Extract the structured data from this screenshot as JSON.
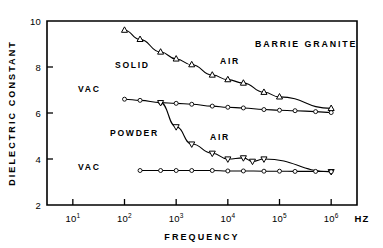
{
  "figure": {
    "annotation_title": "BARRIE GRANITE",
    "x_axis_title": "FREQUENCY",
    "x_axis_unit": "HZ",
    "y_axis_title": "DIELECTRIC CONSTANT",
    "labels": {
      "solid": "SOLID",
      "powder": "POWDER",
      "air_upper": "AIR",
      "air_lower": "AIR",
      "vac_upper": "VAC",
      "vac_lower": "VAC"
    }
  },
  "chart_data": {
    "type": "line",
    "title": "BARRIE GRANITE",
    "xlabel": "FREQUENCY",
    "xunit": "HZ",
    "ylabel": "DIELECTRIC CONSTANT",
    "xscale": "log",
    "yscale": "linear",
    "xlim": [
      3.1622776601683795,
      3162277.6601683795
    ],
    "ylim": [
      2,
      10
    ],
    "x_tick_labels": [
      "10¹",
      "10²",
      "10³",
      "10⁴",
      "10⁵",
      "10⁶"
    ],
    "x_tick_bases": [
      "10",
      "10",
      "10",
      "10",
      "10",
      "10"
    ],
    "x_tick_exponents": [
      "1",
      "2",
      "3",
      "4",
      "5",
      "6"
    ],
    "x_tick_values": [
      10,
      100,
      1000,
      10000,
      100000,
      1000000
    ],
    "y_ticks": [
      2,
      4,
      6,
      8,
      10
    ],
    "y_tick_labels": [
      "2",
      "4",
      "6",
      "8",
      "10"
    ],
    "grid": false,
    "legend": "inline-annotations",
    "series": [
      {
        "name": "SOLID AIR",
        "sample": "SOLID",
        "medium": "AIR",
        "marker": "triangle-up",
        "x": [
          100,
          200,
          500,
          1000,
          2000,
          5000,
          10000,
          20000,
          50000,
          100000,
          1000000
        ],
        "y": [
          9.6,
          9.2,
          8.65,
          8.35,
          8.1,
          7.65,
          7.45,
          7.3,
          6.9,
          6.7,
          6.2
        ]
      },
      {
        "name": "SOLID VAC",
        "sample": "SOLID",
        "medium": "VAC",
        "marker": "circle",
        "x": [
          100,
          200,
          500,
          1000,
          2000,
          5000,
          10000,
          20000,
          50000,
          100000,
          200000,
          500000,
          1000000
        ],
        "y": [
          6.6,
          6.55,
          6.45,
          6.42,
          6.38,
          6.3,
          6.25,
          6.22,
          6.15,
          6.12,
          6.1,
          6.06,
          6.02
        ]
      },
      {
        "name": "POWDER AIR",
        "sample": "POWDER",
        "medium": "AIR",
        "marker": "triangle-down",
        "x": [
          500,
          1000,
          2000,
          5000,
          10000,
          20000,
          30000,
          50000,
          1000000
        ],
        "y": [
          6.45,
          5.4,
          4.65,
          4.25,
          4.0,
          4.05,
          3.9,
          4.0,
          3.45
        ]
      },
      {
        "name": "POWDER VAC",
        "sample": "POWDER",
        "medium": "VAC",
        "marker": "circle",
        "x": [
          200,
          500,
          1000,
          2000,
          5000,
          10000,
          20000,
          50000,
          100000,
          200000,
          500000,
          1000000
        ],
        "y": [
          3.5,
          3.5,
          3.5,
          3.5,
          3.5,
          3.48,
          3.48,
          3.47,
          3.47,
          3.46,
          3.46,
          3.45
        ]
      }
    ]
  }
}
